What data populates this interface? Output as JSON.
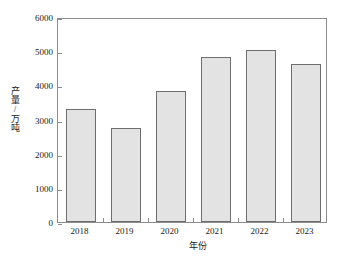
{
  "chart_data": {
    "type": "bar",
    "title": "",
    "subtitle": "",
    "xlabel": "年份",
    "ylabel": "产量/万吨",
    "categories": [
      "2018",
      "2019",
      "2020",
      "2021",
      "2022",
      "2023"
    ],
    "values": [
      3320,
      2750,
      3840,
      4840,
      5030,
      4620
    ],
    "series": [
      {
        "name": "产量",
        "values": [
          3320,
          2750,
          3840,
          4840,
          5030,
          4620
        ]
      }
    ],
    "ylim": [
      0,
      6000
    ],
    "ytick_values": [
      0,
      1000,
      2000,
      3000,
      4000,
      5000,
      6000
    ],
    "ytick_labels": [
      "0",
      "1000",
      "2000",
      "3000",
      "4000",
      "5000",
      "6000"
    ],
    "xtick_labels": [
      "2018",
      "2019",
      "2020",
      "2021",
      "2022",
      "2023"
    ],
    "grid": false,
    "legend": false,
    "legend_position": "none",
    "annotations": [],
    "colors": {
      "bar_fill": "#e3e3e3",
      "bar_border": "#6e6e6e",
      "axis": "#8c8c8c",
      "text": "#1a1a1a",
      "background": "#ffffff"
    }
  }
}
